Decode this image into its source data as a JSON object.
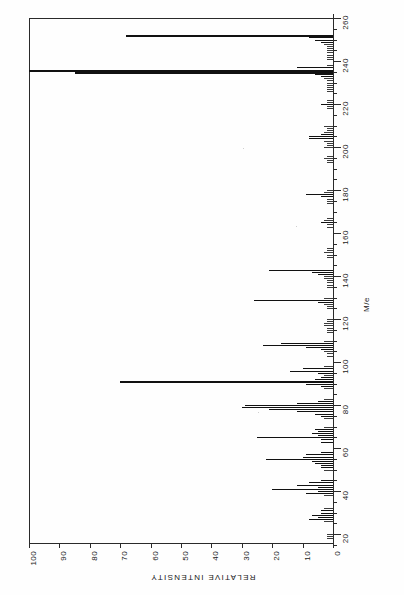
{
  "figure": {
    "type": "mass-spectrum",
    "axis_mass_title": "M/e",
    "axis_intensity_title": "RELATIVE INTENSITY"
  },
  "mass_axis": {
    "labels": [
      "260",
      "240",
      "220",
      "200",
      "180",
      "160",
      "140",
      "120",
      "100",
      "80",
      "60",
      "40",
      "20"
    ],
    "values": [
      260,
      240,
      220,
      200,
      180,
      160,
      140,
      120,
      100,
      80,
      60,
      40,
      20
    ],
    "min": 14,
    "max": 262,
    "minor_step": 5
  },
  "intensity_axis": {
    "labels": [
      "100",
      "90",
      "80",
      "70",
      "60",
      "50",
      "40",
      "30",
      "20",
      "10",
      "0"
    ],
    "values": [
      100,
      90,
      80,
      70,
      60,
      50,
      40,
      30,
      20,
      10,
      0
    ],
    "min": 0,
    "max": 100
  },
  "chart_data": {
    "type": "bar",
    "title": "",
    "xlabel": "M/e",
    "ylabel": "RELATIVE INTENSITY",
    "xlim": [
      14,
      262
    ],
    "ylim": [
      0,
      100
    ],
    "grid": false,
    "legend": "none",
    "orientation": "horizontal-bars-mass-vertical",
    "categories": [
      252,
      251,
      250,
      249,
      248,
      247,
      246,
      245,
      244,
      243,
      242,
      241,
      238,
      237,
      236,
      235,
      234,
      233,
      232,
      231,
      230,
      229,
      228,
      227,
      226,
      222,
      221,
      220,
      219,
      218,
      210,
      209,
      208,
      207,
      206,
      205,
      204,
      203,
      202,
      201,
      200,
      196,
      195,
      194,
      193,
      180,
      179,
      178,
      177,
      176,
      175,
      174,
      167,
      166,
      165,
      164,
      163,
      153,
      152,
      151,
      150,
      149,
      143,
      142,
      141,
      140,
      139,
      138,
      137,
      136,
      135,
      130,
      129,
      128,
      127,
      126,
      125,
      120,
      119,
      118,
      117,
      116,
      115,
      114,
      110,
      109,
      108,
      107,
      106,
      105,
      104,
      103,
      98,
      97,
      96,
      95,
      94,
      93,
      92,
      91,
      90,
      89,
      88,
      83,
      82,
      81,
      80,
      79,
      78,
      77,
      76,
      75,
      74,
      70,
      69,
      68,
      67,
      66,
      65,
      64,
      63,
      58,
      57,
      56,
      55,
      54,
      53,
      52,
      51,
      50,
      45,
      44,
      43,
      42,
      41,
      40,
      39,
      38,
      32,
      31,
      30,
      29,
      28,
      27,
      26,
      20,
      19,
      18
    ],
    "values": [
      68,
      8,
      6,
      4,
      3,
      2,
      2,
      2,
      2,
      2,
      2,
      2,
      2,
      12,
      100,
      85,
      6,
      4,
      3,
      2,
      2,
      2,
      2,
      2,
      2,
      2,
      2,
      4,
      2,
      2,
      3,
      2,
      2,
      3,
      4,
      8,
      8,
      3,
      2,
      2,
      3,
      2,
      3,
      2,
      2,
      2,
      3,
      9,
      4,
      2,
      2,
      2,
      2,
      3,
      4,
      2,
      2,
      2,
      2,
      3,
      2,
      2,
      21,
      7,
      5,
      3,
      3,
      2,
      2,
      2,
      2,
      3,
      26,
      5,
      3,
      2,
      2,
      2,
      2,
      3,
      3,
      2,
      2,
      2,
      3,
      17,
      23,
      9,
      4,
      3,
      2,
      2,
      3,
      10,
      14,
      5,
      3,
      4,
      6,
      70,
      9,
      4,
      3,
      3,
      5,
      12,
      29,
      30,
      21,
      12,
      6,
      4,
      3,
      3,
      6,
      5,
      7,
      5,
      25,
      4,
      4,
      4,
      9,
      10,
      22,
      7,
      6,
      4,
      4,
      3,
      4,
      8,
      12,
      5,
      20,
      5,
      9,
      3,
      3,
      4,
      4,
      7,
      5,
      8,
      3,
      2,
      2,
      2
    ]
  }
}
